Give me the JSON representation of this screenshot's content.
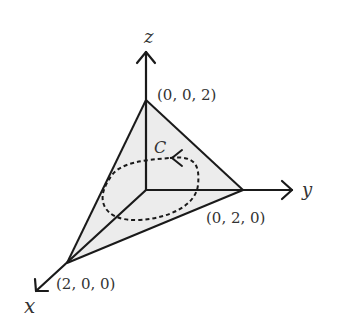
{
  "diagram": {
    "type": "3d-coordinate-plane-triangle",
    "axes": {
      "x_label": "x",
      "y_label": "y",
      "z_label": "z"
    },
    "vertices": {
      "x_vertex": "(2, 0, 0)",
      "y_vertex": "(0, 2, 0)",
      "z_vertex": "(0, 0, 2)"
    },
    "curve_label": "C",
    "colors": {
      "stroke": "#1a1a1a",
      "fill": "#ececec"
    }
  }
}
